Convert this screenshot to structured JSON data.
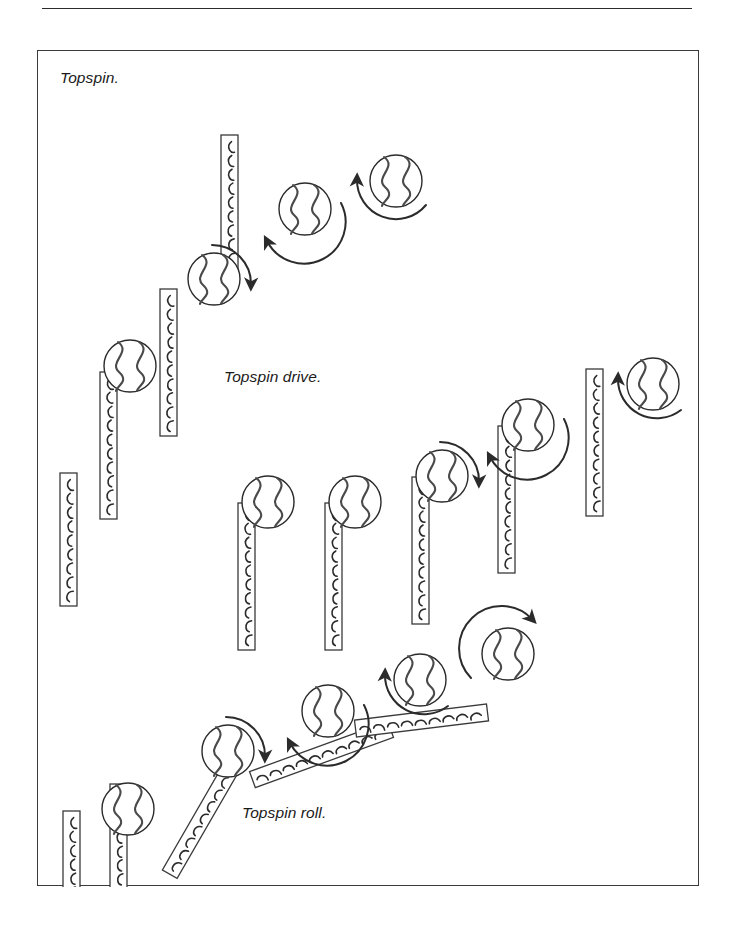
{
  "page": {
    "background_color": "#ffffff",
    "ink_color": "#2b2b2b",
    "top_rule": true,
    "frame": {
      "x": 37,
      "y": 50,
      "w": 662,
      "h": 836
    }
  },
  "captions": [
    {
      "id": "topspin",
      "text": "Topspin.",
      "x": 22,
      "y": 18
    },
    {
      "id": "drive",
      "text": "Topspin drive.",
      "x": 186,
      "y": 317
    },
    {
      "id": "roll",
      "text": "Topspin roll.",
      "x": 204,
      "y": 753
    }
  ],
  "diagram": {
    "type": "table-tennis-stroke-sequence",
    "ball_radius": 26,
    "bat_width": 17,
    "sequences": [
      {
        "name": "topspin",
        "label": "Topspin.",
        "bats": [
          {
            "cx": 22,
            "cy": 422,
            "len": 133,
            "angle": 0,
            "pips": 9
          },
          {
            "cx": 62,
            "cy": 321,
            "len": 147,
            "angle": 0,
            "pips": 10
          },
          {
            "cx": 122,
            "cy": 238,
            "len": 147,
            "angle": 0,
            "pips": 10
          },
          {
            "cx": 183,
            "cy": 84,
            "len": 147,
            "angle": 0,
            "pips": 10
          }
        ],
        "balls": [
          {
            "cx": 92,
            "cy": 315,
            "spin": "none"
          },
          {
            "cx": 176,
            "cy": 228,
            "spin": "clockwise",
            "arrow": "top-to-right"
          },
          {
            "cx": 267,
            "cy": 158,
            "spin": "clockwise",
            "arrow": "right-to-bottom-left"
          },
          {
            "cx": 358,
            "cy": 130,
            "spin": "clockwise",
            "arrow": "bottom-right-to-top-left"
          }
        ]
      },
      {
        "name": "topspin-drive",
        "label": "Topspin drive.",
        "bats": [
          {
            "cx": 200,
            "cy": 452,
            "len": 147,
            "angle": 0,
            "pips": 10
          },
          {
            "cx": 287,
            "cy": 452,
            "len": 147,
            "angle": 0,
            "pips": 10
          },
          {
            "cx": 374,
            "cy": 426,
            "len": 147,
            "angle": 0,
            "pips": 10
          },
          {
            "cx": 460,
            "cy": 375,
            "len": 147,
            "angle": 0,
            "pips": 10
          },
          {
            "cx": 548,
            "cy": 318,
            "len": 147,
            "angle": 0,
            "pips": 10
          }
        ],
        "balls": [
          {
            "cx": 230,
            "cy": 451,
            "spin": "none"
          },
          {
            "cx": 317,
            "cy": 451,
            "spin": "none"
          },
          {
            "cx": 404,
            "cy": 425,
            "spin": "clockwise",
            "arrow": "top-to-right"
          },
          {
            "cx": 490,
            "cy": 374,
            "spin": "clockwise",
            "arrow": "right-to-bottom-left"
          },
          {
            "cx": 615,
            "cy": 333,
            "spin": "clockwise",
            "arrow": "bottom-to-top-left"
          }
        ]
      },
      {
        "name": "topspin-roll",
        "label": "Topspin roll.",
        "bats": [
          {
            "cx": 25,
            "cy": 760,
            "len": 133,
            "angle": 0,
            "pips": 9
          },
          {
            "cx": 72,
            "cy": 733,
            "len": 133,
            "angle": 0,
            "pips": 9
          },
          {
            "cx": 160,
            "cy": 686,
            "len": 147,
            "angle": 30,
            "pips": 10
          },
          {
            "cx": 275,
            "cy": 630,
            "len": 147,
            "angle": 70,
            "pips": 10
          },
          {
            "cx": 375,
            "cy": 603,
            "len": 133,
            "angle": 83,
            "pips": 9
          }
        ],
        "balls": [
          {
            "cx": 90,
            "cy": 758,
            "spin": "none"
          },
          {
            "cx": 190,
            "cy": 700,
            "spin": "clockwise",
            "arrow": "top-to-right"
          },
          {
            "cx": 290,
            "cy": 660,
            "spin": "clockwise",
            "arrow": "right-to-bottom-left"
          },
          {
            "cx": 382,
            "cy": 629,
            "spin": "clockwise",
            "arrow": "bottom-to-top-left"
          },
          {
            "cx": 470,
            "cy": 603,
            "spin": "clockwise",
            "arrow": "left-to-top-right"
          }
        ]
      }
    ]
  }
}
